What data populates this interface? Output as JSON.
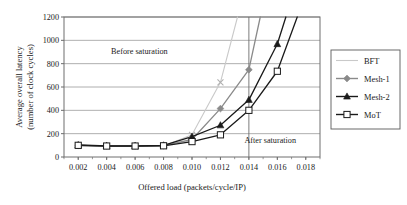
{
  "chart_data": {
    "type": "line",
    "title": "",
    "xlabel": "Offered load (packets/cycle/IP)",
    "ylabel_line1": "Average overall latency",
    "ylabel_line2": "(number of clock cycles)",
    "xlim": [
      0.001,
      0.019
    ],
    "ylim": [
      0,
      1200
    ],
    "xticks": [
      0.002,
      0.004,
      0.006,
      0.008,
      0.01,
      0.012,
      0.014,
      0.016,
      0.018
    ],
    "xtick_labels": [
      "0.002",
      "0.004",
      "0.006",
      "0.008",
      "0.010",
      "0.012",
      "0.014",
      "0.016",
      "0.018"
    ],
    "yticks": [
      0,
      200,
      400,
      600,
      800,
      1000,
      1200
    ],
    "ytick_labels": [
      "0",
      "200",
      "400",
      "600",
      "800",
      "1000",
      "1200"
    ],
    "grid": "horizontal",
    "legend_position": "right-outside",
    "annotations": [
      {
        "text": "Before saturation",
        "x": 0.0063,
        "y": 880
      },
      {
        "text": "After saturation",
        "x": 0.0155,
        "y": 120
      }
    ],
    "saturation_line_x": 0.014,
    "series": [
      {
        "name": "BFT",
        "color": "#c9c9c9",
        "marker": "x",
        "marker_color": "#b0b0b0",
        "x": [
          0.002,
          0.004,
          0.006,
          0.008,
          0.01,
          0.012,
          0.0132
        ],
        "values": [
          95,
          92,
          92,
          95,
          190,
          640,
          1200
        ]
      },
      {
        "name": "Mesh-1",
        "color": "#8a8a8a",
        "marker": "diamond",
        "marker_color": "#8a8a8a",
        "x": [
          0.002,
          0.004,
          0.006,
          0.008,
          0.01,
          0.012,
          0.014,
          0.0148
        ],
        "values": [
          100,
          95,
          95,
          98,
          150,
          415,
          748,
          1200
        ]
      },
      {
        "name": "Mesh-2",
        "color": "#1a1a1a",
        "marker": "triangle",
        "marker_color": "#1a1a1a",
        "x": [
          0.002,
          0.004,
          0.006,
          0.008,
          0.01,
          0.012,
          0.014,
          0.016,
          0.0166
        ],
        "values": [
          103,
          96,
          96,
          100,
          175,
          272,
          490,
          968,
          1200
        ]
      },
      {
        "name": "MoT",
        "color": "#1a1a1a",
        "marker": "square-open",
        "marker_color": "#1a1a1a",
        "x": [
          0.002,
          0.004,
          0.006,
          0.008,
          0.01,
          0.012,
          0.014,
          0.016,
          0.0174
        ],
        "values": [
          100,
          94,
          94,
          96,
          132,
          190,
          400,
          735,
          1200
        ]
      }
    ]
  },
  "legend": {
    "items": [
      {
        "label": "BFT"
      },
      {
        "label": "Mesh-1"
      },
      {
        "label": "Mesh-2"
      },
      {
        "label": "MoT"
      }
    ]
  }
}
